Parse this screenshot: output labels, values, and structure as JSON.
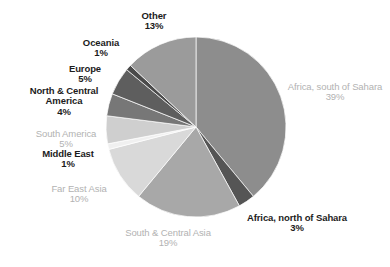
{
  "chart_data": {
    "type": "pie",
    "title": "",
    "legend_position": "none",
    "grid": false,
    "start_angle_deg": 0,
    "direction": "clockwise",
    "units": "percent",
    "categories": [
      "Africa, south of Sahara",
      "Africa, north of Sahara",
      "South & Central Asia",
      "Far East Asia",
      "Middle East",
      "South America",
      "North & Central America",
      "Europe",
      "Oceania",
      "Other"
    ],
    "values": [
      39,
      3,
      19,
      10,
      1,
      5,
      4,
      5,
      1,
      13
    ],
    "value_labels": [
      "39%",
      "3%",
      "19%",
      "10%",
      "1%",
      "5%",
      "4%",
      "5%",
      "1%",
      "13%"
    ],
    "colors": [
      "#8d8d8d",
      "#555555",
      "#a8a8a8",
      "#d9d9d9",
      "#f0f0f0",
      "#cfcfcf",
      "#777777",
      "#5e5e5e",
      "#4a4a4a",
      "#9b9b9b"
    ]
  },
  "slices": [
    {
      "name": "Africa, south of Sahara",
      "value": 39,
      "value_label": "39%",
      "color": "#8d8d8d",
      "label_style": "light"
    },
    {
      "name": "Africa, north of Sahara",
      "value": 3,
      "value_label": "3%",
      "color": "#555555",
      "label_style": "dark"
    },
    {
      "name": "South & Central Asia",
      "value": 19,
      "value_label": "19%",
      "color": "#a8a8a8",
      "label_style": "light"
    },
    {
      "name": "Far East Asia",
      "value": 10,
      "value_label": "10%",
      "color": "#d9d9d9",
      "label_style": "light"
    },
    {
      "name": "Middle East",
      "value": 1,
      "value_label": "1%",
      "color": "#f0f0f0",
      "label_style": "dark"
    },
    {
      "name": "South America",
      "value": 5,
      "value_label": "5%",
      "color": "#cfcfcf",
      "label_style": "light"
    },
    {
      "name": "North & Central America",
      "value": 4,
      "value_label": "4%",
      "color": "#777777",
      "label_style": "dark"
    },
    {
      "name": "Europe",
      "value": 5,
      "value_label": "5%",
      "color": "#5e5e5e",
      "label_style": "dark"
    },
    {
      "name": "Oceania",
      "value": 1,
      "value_label": "1%",
      "color": "#4a4a4a",
      "label_style": "dark"
    },
    {
      "name": "Other",
      "value": 13,
      "value_label": "13%",
      "color": "#9b9b9b",
      "label_style": "dark"
    }
  ],
  "geometry": {
    "center_x": 196,
    "center_y": 127,
    "radius": 90
  }
}
